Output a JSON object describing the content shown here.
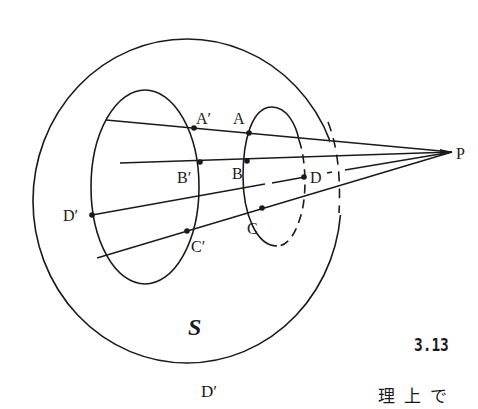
{
  "figure": {
    "number": "3.13",
    "region_label": "S",
    "points": {
      "P": "P",
      "A": "A",
      "A_prime": "A′",
      "B": "B",
      "B_prime": "B′",
      "C": "C",
      "C_prime": "C′",
      "D": "D",
      "D_prime": "D′"
    },
    "colors": {
      "stroke": "#1a1a1a",
      "background": "#ffffff"
    }
  },
  "footer": {
    "fragment_left": "D′",
    "fragment_right": "理上で"
  }
}
